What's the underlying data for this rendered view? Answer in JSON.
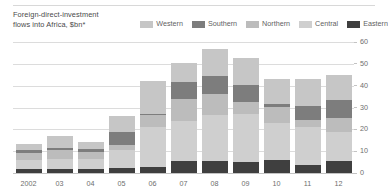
{
  "chart_data": {
    "type": "bar",
    "subtype": "stacked-bar",
    "title": "Foreign-direct-investment\nflows into Africa, $bn*",
    "xlabel": "",
    "ylabel": "",
    "ylim": [
      0,
      60
    ],
    "yticks": [
      0,
      10,
      20,
      30,
      40,
      50,
      60
    ],
    "ytick_labels": [
      "0",
      "10",
      "20",
      "30",
      "40",
      "50",
      "60"
    ],
    "grid": true,
    "legend_position": "top-right",
    "categories": [
      "2002",
      "03",
      "04",
      "05",
      "06",
      "07",
      "08",
      "09",
      "10",
      "11",
      "12"
    ],
    "series": [
      {
        "name": "Eastern",
        "color": "#3f3f3f",
        "values": [
          1.8,
          1.7,
          1.8,
          2.4,
          2.7,
          5.4,
          5.5,
          5.2,
          5.9,
          3.5,
          5.6
        ]
      },
      {
        "name": "Central",
        "color": "#cfcfcf",
        "values": [
          4.0,
          4.6,
          4.5,
          8.0,
          18.3,
          18.6,
          21.0,
          22.0,
          17.2,
          17.5,
          13.0
        ]
      },
      {
        "name": "Northern",
        "color": "#bcbcbc",
        "values": [
          3.2,
          4.2,
          3.5,
          2.5,
          5.5,
          10.0,
          9.5,
          5.5,
          7.0,
          3.5,
          6.5
        ]
      },
      {
        "name": "Southern",
        "color": "#7d7d7d",
        "values": [
          1.5,
          1.0,
          1.0,
          6.0,
          0.6,
          7.5,
          8.5,
          7.5,
          1.6,
          6.0,
          8.5
        ]
      },
      {
        "name": "Western",
        "color": "#c6c6c6",
        "values": [
          3.0,
          5.5,
          3.2,
          7.1,
          14.9,
          9.0,
          12.5,
          12.3,
          11.3,
          12.5,
          11.4
        ]
      }
    ]
  },
  "chart": {
    "title": "Foreign-direct-investment\nflows into Africa, $bn*",
    "legend": [
      {
        "label": "Western",
        "color": "#c6c6c6"
      },
      {
        "label": "Southern",
        "color": "#7d7d7d"
      },
      {
        "label": "Northern",
        "color": "#bcbcbc"
      },
      {
        "label": "Central",
        "color": "#cfcfcf"
      },
      {
        "label": "Eastern",
        "color": "#3f3f3f"
      }
    ]
  }
}
